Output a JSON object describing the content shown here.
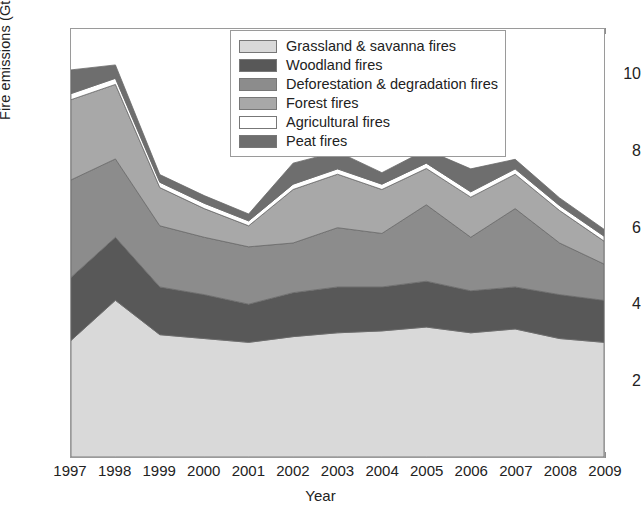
{
  "chart_data": {
    "type": "area",
    "stacked": true,
    "title": "",
    "xlabel": "Year",
    "ylabel": "Fire emissions (Gt CO2 year-1)",
    "ylabel_parts": {
      "prefix": "Fire emissions (Gt CO",
      "sub": "2",
      "mid": " year",
      "sup": "-1",
      "suffix": ")"
    },
    "categories": [
      1997,
      1998,
      1999,
      2000,
      2001,
      2002,
      2003,
      2004,
      2005,
      2006,
      2007,
      2008,
      2009
    ],
    "x_tick_labels": [
      "1997",
      "1998",
      "1999",
      "2000",
      "2001",
      "2002",
      "2003",
      "2004",
      "2005",
      "2006",
      "2007",
      "2008",
      "2009"
    ],
    "y_tick_labels": [
      "2",
      "4",
      "6",
      "8",
      "10"
    ],
    "y_tick_values": [
      2,
      4,
      6,
      8,
      10
    ],
    "ylim": [
      0,
      11.2
    ],
    "xlim": [
      1997,
      2009
    ],
    "grid": false,
    "legend_position": "top-center",
    "series": [
      {
        "name": "Grassland & savanna fires",
        "color": "#d9d9d9",
        "values": [
          3.05,
          4.1,
          3.2,
          3.1,
          3.0,
          3.15,
          3.25,
          3.3,
          3.4,
          3.25,
          3.35,
          3.1,
          3.0
        ]
      },
      {
        "name": "Woodland fires",
        "color": "#585858",
        "values": [
          1.65,
          1.65,
          1.25,
          1.15,
          1.0,
          1.15,
          1.2,
          1.15,
          1.2,
          1.1,
          1.1,
          1.15,
          1.1
        ]
      },
      {
        "name": "Deforestation & degradation fires",
        "color": "#8c8c8c",
        "values": [
          2.55,
          2.05,
          1.6,
          1.5,
          1.5,
          1.3,
          1.55,
          1.4,
          2.0,
          1.4,
          2.05,
          1.35,
          0.95
        ]
      },
      {
        "name": "Forest fires",
        "color": "#a8a8a8",
        "values": [
          2.1,
          1.95,
          1.0,
          0.75,
          0.55,
          1.4,
          1.4,
          1.15,
          0.95,
          1.05,
          0.9,
          0.85,
          0.6
        ]
      },
      {
        "name": "Agricultural fires",
        "color": "#ffffff",
        "values": [
          0.16,
          0.16,
          0.14,
          0.14,
          0.13,
          0.14,
          0.14,
          0.14,
          0.14,
          0.14,
          0.14,
          0.13,
          0.13
        ]
      },
      {
        "name": "Peat fires",
        "color": "#6e6e6e",
        "values": [
          0.62,
          0.35,
          0.2,
          0.2,
          0.18,
          0.55,
          0.45,
          0.3,
          0.35,
          0.6,
          0.25,
          0.2,
          0.18
        ]
      }
    ],
    "totals": [
      10.13,
      10.26,
      7.39,
      6.84,
      6.36,
      7.69,
      7.99,
      7.44,
      8.04,
      7.54,
      7.79,
      6.78,
      5.96
    ]
  },
  "legend": {
    "items": [
      {
        "label": "Grassland & savanna fires",
        "color": "#d9d9d9"
      },
      {
        "label": "Woodland fires",
        "color": "#585858"
      },
      {
        "label": "Deforestation & degradation fires",
        "color": "#8c8c8c"
      },
      {
        "label": "Forest fires",
        "color": "#a8a8a8"
      },
      {
        "label": "Agricultural fires",
        "color": "#ffffff"
      },
      {
        "label": "Peat fires",
        "color": "#6e6e6e"
      }
    ]
  },
  "axes": {
    "y_label_prefix": "Fire emissions (Gt CO",
    "y_label_sub": "2",
    "y_label_mid": " year",
    "y_label_sup": "-1",
    "y_label_suffix": ")",
    "x_label": "Year"
  }
}
